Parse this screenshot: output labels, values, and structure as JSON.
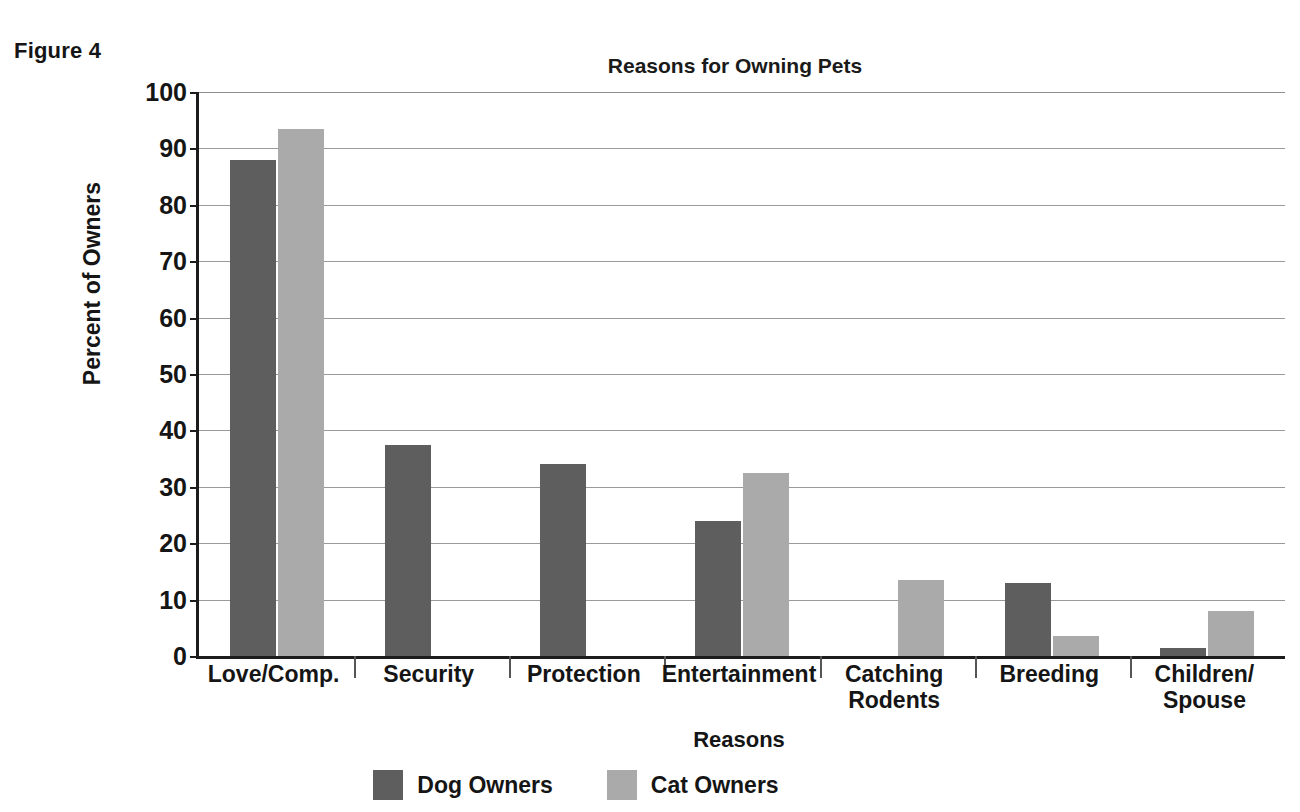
{
  "figure": {
    "label": "Figure 4"
  },
  "chart_data": {
    "type": "bar",
    "title": "Reasons for Owning Pets",
    "xlabel": "Reasons",
    "ylabel": "Percent of Owners",
    "ylim": [
      0,
      100
    ],
    "ytick_labels": [
      "100",
      "90",
      "80",
      "70",
      "60",
      "50",
      "40",
      "30",
      "20",
      "10",
      "0"
    ],
    "yticks": [
      100,
      90,
      80,
      70,
      60,
      50,
      40,
      30,
      20,
      10,
      0
    ],
    "grid": true,
    "legend_position": "bottom",
    "categories": [
      "Love/Comp.",
      "Security",
      "Protection",
      "Entertainment",
      "Catching\nRodents",
      "Breeding",
      "Children/\nSpouse"
    ],
    "category_lines": [
      [
        "Love/Comp."
      ],
      [
        "Security"
      ],
      [
        "Protection"
      ],
      [
        "Entertainment"
      ],
      [
        "Catching",
        "Rodents"
      ],
      [
        "Breeding"
      ],
      [
        "Children/",
        "Spouse"
      ]
    ],
    "series": [
      {
        "name": "Dog Owners",
        "color": "#5e5e5e",
        "values": [
          88,
          37.5,
          34,
          24,
          0,
          13,
          1.5
        ]
      },
      {
        "name": "Cat Owners",
        "color": "#aaaaaa",
        "values": [
          93.5,
          0,
          0,
          32.5,
          13.5,
          3.5,
          8
        ]
      }
    ]
  },
  "legend": {
    "items": [
      {
        "label": "Dog Owners",
        "swatch": "dog"
      },
      {
        "label": "Cat Owners",
        "swatch": "cat"
      }
    ]
  }
}
